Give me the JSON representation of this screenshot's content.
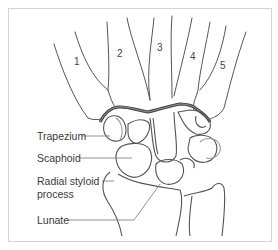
{
  "figure": {
    "type": "anatomical-diagram",
    "metacarpals": [
      {
        "label": "1"
      },
      {
        "label": "2"
      },
      {
        "label": "3"
      },
      {
        "label": "4"
      },
      {
        "label": "5"
      }
    ],
    "labels": [
      {
        "text": "Trapezium"
      },
      {
        "text": "Scaphoid"
      },
      {
        "text": "Radial styloid"
      },
      {
        "text": "process"
      },
      {
        "text": "Lunate"
      }
    ],
    "colors": {
      "bone_outline": "#555555",
      "joint_line": "#4a4a4a",
      "pointer_line": "#777777",
      "frame": "#d4d4d4"
    }
  }
}
